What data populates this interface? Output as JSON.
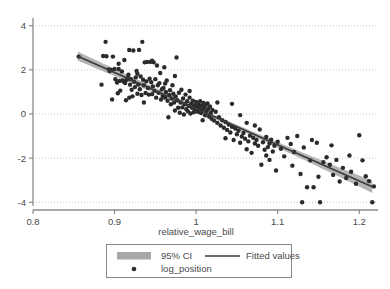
{
  "chart_data": {
    "type": "scatter",
    "title": "",
    "xlabel": "relative_wage_bill",
    "ylabel": "",
    "xlim": [
      0.8,
      1.223
    ],
    "ylim": [
      -4.35,
      4.35
    ],
    "grid": true,
    "xticks": [
      0.8,
      0.9,
      1.0,
      1.1,
      1.2
    ],
    "xticklabels": [
      "0.8",
      "0.9",
      "1",
      "1.1",
      "1.2"
    ],
    "yticks": [
      4,
      2,
      0,
      -2,
      -4
    ],
    "yticklabels": [
      "4",
      "2",
      "0",
      "-2",
      "-4"
    ],
    "legend_position": "below-center",
    "legend_entries": [
      {
        "key": "ci",
        "label": "95% CI",
        "marker": "band",
        "color": "#a8a8a8"
      },
      {
        "key": "fit",
        "label": "Fitted values",
        "marker": "line",
        "color": "#3a3a3a"
      },
      {
        "key": "points",
        "label": "log_position",
        "marker": "dot",
        "color": "#2b2b2b"
      }
    ],
    "fit_line": {
      "x_start": 0.855,
      "y_start": 2.62,
      "x_end": 1.216,
      "y_end": -3.3,
      "slope": -16.5,
      "intercept": 16.72,
      "color": "#3a3a3a"
    },
    "ci_band": {
      "color": "#a8a8a8",
      "half_width_min": 0.09,
      "half_width_max": 0.28
    },
    "series": [
      {
        "name": "log_position",
        "marker": "circle",
        "color": "#2b2b2b",
        "n": 205,
        "points": [
          [
            0.856,
            2.6
          ],
          [
            0.884,
            1.33
          ],
          [
            0.886,
            2.63
          ],
          [
            0.889,
            3.27
          ],
          [
            0.89,
            2.62
          ],
          [
            0.893,
            2.02
          ],
          [
            0.894,
            1.95
          ],
          [
            0.896,
            2.0
          ],
          [
            0.897,
            0.66
          ],
          [
            0.898,
            2.6
          ],
          [
            0.9,
            2.04
          ],
          [
            0.901,
            1.58
          ],
          [
            0.903,
            1.43
          ],
          [
            0.904,
            0.94
          ],
          [
            0.905,
            2.28
          ],
          [
            0.906,
            1.5
          ],
          [
            0.907,
            1.06
          ],
          [
            0.909,
            1.93
          ],
          [
            0.91,
            1.52
          ],
          [
            0.911,
            1.47
          ],
          [
            0.912,
            2.45
          ],
          [
            0.913,
            1.4
          ],
          [
            0.914,
            0.62
          ],
          [
            0.915,
            1.55
          ],
          [
            0.916,
            1.62
          ],
          [
            0.917,
            1.78
          ],
          [
            0.918,
            2.9
          ],
          [
            0.919,
            1.33
          ],
          [
            0.92,
            1.58
          ],
          [
            0.921,
            1.1
          ],
          [
            0.922,
            0.8
          ],
          [
            0.923,
            2.88
          ],
          [
            0.924,
            1.46
          ],
          [
            0.925,
            1.22
          ],
          [
            0.926,
            1.66
          ],
          [
            0.927,
            1.95
          ],
          [
            0.928,
            0.92
          ],
          [
            0.929,
            1.34
          ],
          [
            0.93,
            2.9
          ],
          [
            0.931,
            1.12
          ],
          [
            0.932,
            1.7
          ],
          [
            0.933,
            0.86
          ],
          [
            0.934,
            3.27
          ],
          [
            0.935,
            1.55
          ],
          [
            0.936,
            1.3
          ],
          [
            0.937,
            2.34
          ],
          [
            0.938,
            0.95
          ],
          [
            0.939,
            1.48
          ],
          [
            0.94,
            2.36
          ],
          [
            0.941,
            1.18
          ],
          [
            0.942,
            0.88
          ],
          [
            0.943,
            1.6
          ],
          [
            0.944,
            2.36
          ],
          [
            0.945,
            1.44
          ],
          [
            0.946,
            0.9
          ],
          [
            0.947,
            1.25
          ],
          [
            0.948,
            2.34
          ],
          [
            0.949,
            1.05
          ],
          [
            0.95,
            1.58
          ],
          [
            0.951,
            0.74
          ],
          [
            0.952,
            2.2
          ],
          [
            0.953,
            1.3
          ],
          [
            0.954,
            0.96
          ],
          [
            0.955,
            1.4
          ],
          [
            0.956,
            1.86
          ],
          [
            0.957,
            0.66
          ],
          [
            0.958,
            1.12
          ],
          [
            0.959,
            0.82
          ],
          [
            0.96,
            1.18
          ],
          [
            0.961,
            2.12
          ],
          [
            0.962,
            0.74
          ],
          [
            0.963,
            1.0
          ],
          [
            0.964,
            1.52
          ],
          [
            0.965,
            0.6
          ],
          [
            0.966,
            -0.15
          ],
          [
            0.967,
            0.86
          ],
          [
            0.968,
            1.08
          ],
          [
            0.969,
            0.44
          ],
          [
            0.97,
            0.7
          ],
          [
            0.971,
            1.3
          ],
          [
            0.972,
            0.92
          ],
          [
            0.973,
            0.52
          ],
          [
            0.974,
            0.16
          ],
          [
            0.975,
            0.8
          ],
          [
            0.976,
            2.56
          ],
          [
            0.977,
            0.62
          ],
          [
            0.978,
            0.28
          ],
          [
            0.979,
            0.96
          ],
          [
            0.98,
            0.06
          ],
          [
            0.981,
            0.52
          ],
          [
            0.982,
            1.1
          ],
          [
            0.983,
            0.3
          ],
          [
            0.984,
            0.7
          ],
          [
            0.985,
            -0.02
          ],
          [
            0.986,
            0.44
          ],
          [
            0.987,
            0.88
          ],
          [
            0.988,
            0.22
          ],
          [
            0.989,
            0.58
          ],
          [
            0.99,
            0.12
          ],
          [
            0.991,
            0.36
          ],
          [
            0.992,
            0.74
          ],
          [
            0.993,
            0.02
          ],
          [
            0.994,
            0.48
          ],
          [
            0.995,
            0.28
          ],
          [
            0.996,
            0.6
          ],
          [
            0.997,
            0.08
          ],
          [
            0.998,
            0.4
          ],
          [
            0.999,
            0.22
          ],
          [
            1.0,
            0.55
          ],
          [
            1.001,
            0.34
          ],
          [
            1.002,
            0.1
          ],
          [
            1.003,
            0.44
          ],
          [
            1.004,
            0.26
          ],
          [
            1.005,
            0.58
          ],
          [
            1.006,
            0.04
          ],
          [
            1.007,
            0.38
          ],
          [
            1.008,
            0.18
          ],
          [
            1.009,
            0.5
          ],
          [
            1.01,
            0.3
          ],
          [
            1.011,
            -0.06
          ],
          [
            1.012,
            0.42
          ],
          [
            1.013,
            0.14
          ],
          [
            1.014,
            0.48
          ],
          [
            1.015,
            0.24
          ],
          [
            1.016,
            -0.12
          ],
          [
            1.017,
            0.34
          ],
          [
            1.018,
            0.05
          ],
          [
            1.019,
            -0.22
          ],
          [
            1.02,
            0.18
          ],
          [
            1.022,
            -0.3
          ],
          [
            1.024,
            0.1
          ],
          [
            1.026,
            -0.4
          ],
          [
            1.028,
            -0.15
          ],
          [
            1.03,
            -0.52
          ],
          [
            1.032,
            -0.28
          ],
          [
            1.034,
            -0.62
          ],
          [
            1.036,
            -0.36
          ],
          [
            1.038,
            -0.72
          ],
          [
            1.04,
            -0.48
          ],
          [
            1.042,
            -0.84
          ],
          [
            1.044,
            -0.58
          ],
          [
            1.046,
            -1.18
          ],
          [
            1.048,
            -0.66
          ],
          [
            1.05,
            -0.92
          ],
          [
            1.052,
            -0.76
          ],
          [
            1.054,
            -0.05
          ],
          [
            1.056,
            -1.02
          ],
          [
            1.058,
            -0.86
          ],
          [
            1.06,
            -1.12
          ],
          [
            1.062,
            -0.4
          ],
          [
            1.064,
            -1.24
          ],
          [
            1.066,
            -0.98
          ],
          [
            1.068,
            -1.76
          ],
          [
            1.07,
            -1.08
          ],
          [
            1.072,
            -1.34
          ],
          [
            1.074,
            -1.18
          ],
          [
            1.076,
            -1.44
          ],
          [
            1.078,
            -0.7
          ],
          [
            1.08,
            -2.3
          ],
          [
            1.082,
            -1.28
          ],
          [
            1.084,
            -1.62
          ],
          [
            1.086,
            -1.04
          ],
          [
            1.088,
            -1.5
          ],
          [
            1.09,
            -1.34
          ],
          [
            1.092,
            -1.16
          ],
          [
            1.094,
            -1.7
          ],
          [
            1.096,
            -1.44
          ],
          [
            1.098,
            -2.56
          ],
          [
            1.1,
            -1.26
          ],
          [
            1.104,
            -1.58
          ],
          [
            1.108,
            -1.92
          ],
          [
            1.112,
            -1.08
          ],
          [
            1.116,
            -1.36
          ],
          [
            1.12,
            -1.72
          ],
          [
            1.124,
            -1.0
          ],
          [
            1.128,
            -2.72
          ],
          [
            1.13,
            -4.0
          ],
          [
            1.132,
            -1.52
          ],
          [
            1.136,
            -3.32
          ],
          [
            1.14,
            -2.1
          ],
          [
            1.144,
            -3.32
          ],
          [
            1.148,
            -1.3
          ],
          [
            1.15,
            -2.84
          ],
          [
            1.152,
            -4.0
          ],
          [
            1.156,
            -2.18
          ],
          [
            1.16,
            -1.96
          ],
          [
            1.164,
            -2.3
          ],
          [
            1.168,
            -2.76
          ],
          [
            1.172,
            -2.08
          ],
          [
            1.176,
            -3.06
          ],
          [
            1.18,
            -2.44
          ],
          [
            1.184,
            -2.9
          ],
          [
            1.19,
            -2.62
          ],
          [
            1.196,
            -3.16
          ],
          [
            1.2,
            -0.96
          ],
          [
            1.204,
            -2.1
          ],
          [
            1.208,
            -2.82
          ],
          [
            1.212,
            -3.04
          ],
          [
            1.216,
            -4.0
          ],
          [
            1.218,
            -3.28
          ],
          [
            0.905,
            2.04
          ],
          [
            0.928,
            1.82
          ],
          [
            0.946,
            2.42
          ],
          [
            0.962,
            1.38
          ],
          [
            0.992,
            1.04
          ],
          [
            1.008,
            -0.28
          ],
          [
            1.036,
            -1.1
          ],
          [
            1.054,
            -1.3
          ],
          [
            1.072,
            -0.52
          ],
          [
            1.09,
            -2.08
          ],
          [
            1.118,
            -2.34
          ],
          [
            1.142,
            -1.18
          ],
          [
            1.166,
            -1.42
          ],
          [
            1.188,
            -1.88
          ],
          [
            1.044,
            0.46
          ],
          [
            0.974,
            1.72
          ],
          [
            0.936,
            0.52
          ],
          [
            0.918,
            0.74
          ],
          [
            1.026,
            0.52
          ],
          [
            1.062,
            -1.6
          ],
          [
            1.086,
            -1.88
          ]
        ]
      }
    ]
  },
  "axis": {
    "x_title": "relative_wage_bill"
  }
}
